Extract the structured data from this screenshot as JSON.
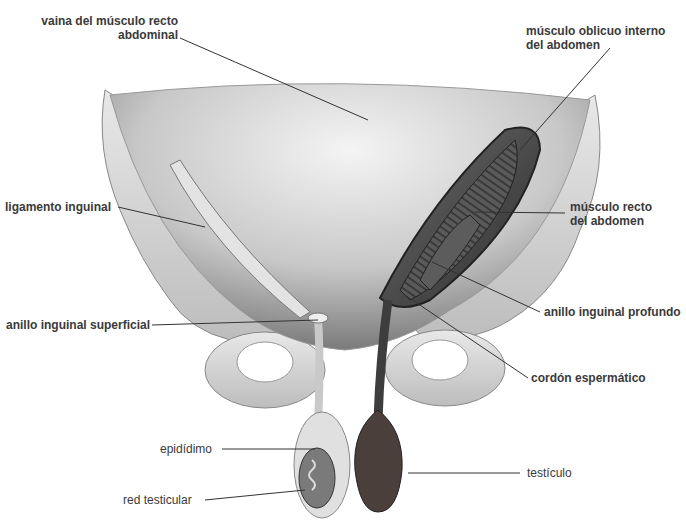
{
  "figure": {
    "labels": [
      {
        "id": "vaina",
        "line1": "vaina del músculo recto",
        "line2": "abdominal"
      },
      {
        "id": "oblicuo",
        "line1": "músculo oblicuo interno",
        "line2": "del abdomen"
      },
      {
        "id": "ligamento",
        "line1": "ligamento inguinal"
      },
      {
        "id": "recto",
        "line1": "músculo recto",
        "line2": "del abdomen"
      },
      {
        "id": "anillo_sup",
        "line1": "anillo inguinal superficial"
      },
      {
        "id": "anillo_prof",
        "line1": "anillo inguinal profundo"
      },
      {
        "id": "cordon",
        "line1": "cordón espermático"
      },
      {
        "id": "epididimo",
        "line1": "epidídimo"
      },
      {
        "id": "testiculo",
        "line1": "testículo"
      },
      {
        "id": "red",
        "line1": "red testicular"
      }
    ]
  }
}
